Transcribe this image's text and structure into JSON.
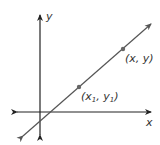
{
  "diagram": {
    "type": "coordinate-line",
    "axes": {
      "x_label": "x",
      "y_label": "y"
    },
    "points": [
      {
        "label_base_x": "x",
        "label_base_y": "y",
        "sub": "1",
        "display": "(x1, y1)"
      },
      {
        "display": "(x, y)"
      }
    ],
    "colors": {
      "axis": "#222222",
      "line": "#555555",
      "point": "#666666"
    }
  }
}
